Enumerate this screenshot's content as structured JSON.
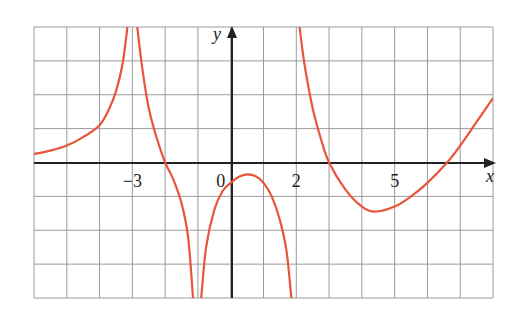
{
  "chart_data": {
    "type": "line",
    "title": "",
    "xlabel": "x",
    "ylabel": "y",
    "xlim": [
      -6,
      8
    ],
    "ylim": [
      -4,
      4
    ],
    "grid": true,
    "grid_step": 1,
    "tick_labels": [
      {
        "x": -3,
        "label": "−3"
      },
      {
        "x": 0,
        "label": "0"
      },
      {
        "x": 2,
        "label": "2"
      },
      {
        "x": 5,
        "label": "5"
      }
    ],
    "vertical_asymptotes": [
      -3,
      -1,
      2
    ],
    "curve_color": "#e8553a",
    "series": [
      {
        "name": "branch-1",
        "points": [
          [
            -6,
            0.25
          ],
          [
            -5.5,
            0.35
          ],
          [
            -5,
            0.5
          ],
          [
            -4.5,
            0.75
          ],
          [
            -4,
            1.1
          ],
          [
            -3.7,
            1.6
          ],
          [
            -3.5,
            2.1
          ],
          [
            -3.3,
            2.9
          ],
          [
            -3.15,
            4
          ]
        ]
      },
      {
        "name": "branch-2",
        "points": [
          [
            -2.85,
            4
          ],
          [
            -2.7,
            2.8
          ],
          [
            -2.5,
            1.6
          ],
          [
            -2.25,
            0.7
          ],
          [
            -2,
            0
          ],
          [
            -1.75,
            -0.5
          ],
          [
            -1.5,
            -1.2
          ],
          [
            -1.3,
            -2.2
          ],
          [
            -1.15,
            -4
          ]
        ]
      },
      {
        "name": "branch-3",
        "points": [
          [
            -0.9,
            -4
          ],
          [
            -0.75,
            -2.5
          ],
          [
            -0.5,
            -1.4
          ],
          [
            -0.25,
            -0.85
          ],
          [
            0,
            -0.6
          ],
          [
            0.25,
            -0.42
          ],
          [
            0.5,
            -0.35
          ],
          [
            0.75,
            -0.4
          ],
          [
            1,
            -0.6
          ],
          [
            1.25,
            -1.0
          ],
          [
            1.5,
            -1.7
          ],
          [
            1.7,
            -2.6
          ],
          [
            1.85,
            -4
          ]
        ]
      },
      {
        "name": "branch-4",
        "points": [
          [
            2.1,
            4
          ],
          [
            2.25,
            2.9
          ],
          [
            2.5,
            1.6
          ],
          [
            2.75,
            0.7
          ],
          [
            3,
            0
          ],
          [
            3.5,
            -0.8
          ],
          [
            4,
            -1.3
          ],
          [
            4.4,
            -1.45
          ],
          [
            5,
            -1.3
          ],
          [
            5.5,
            -1.0
          ],
          [
            6,
            -0.6
          ],
          [
            6.6,
            0
          ],
          [
            7,
            0.5
          ],
          [
            7.5,
            1.2
          ],
          [
            8,
            1.9
          ]
        ]
      }
    ]
  },
  "axes": {
    "x_label": "x",
    "y_label": "y"
  }
}
